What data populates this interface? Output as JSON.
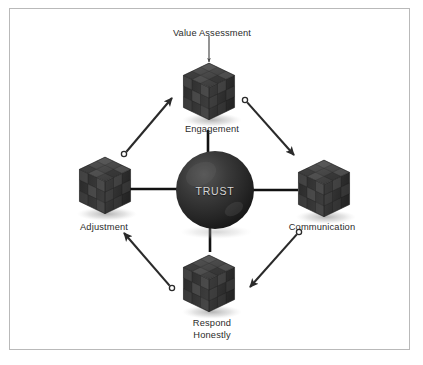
{
  "figure": {
    "title_text": "Trust cycle diagram",
    "center": {
      "label": "TRUST",
      "shape": "sphere",
      "color": "#2e2e2e",
      "label_color": "#d5d5d5",
      "cx": 215,
      "cy": 190,
      "r": 39
    },
    "frame": {
      "border_color": "#b9b9b9",
      "background": "#ffffff"
    },
    "nodes": [
      {
        "id": "engagement",
        "label": "Engagement",
        "icon": "cube-icon",
        "position": "top",
        "cx": 208,
        "cy": 93,
        "label_x": 212,
        "label_y": 124
      },
      {
        "id": "communication",
        "label": "Communication",
        "icon": "cube-icon",
        "position": "right",
        "cx": 322,
        "cy": 190,
        "label_x": 322,
        "label_y": 222
      },
      {
        "id": "respond-honestly",
        "label": "Respond\nHonestly",
        "label_line_1": "Respond",
        "label_line_2": "Honestly",
        "icon": "cube-icon",
        "position": "bottom",
        "cx": 208,
        "cy": 285,
        "label_x": 212,
        "label_y": 318
      },
      {
        "id": "adjustment",
        "label": "Adjustment",
        "icon": "cube-icon",
        "position": "left",
        "cx": 103,
        "cy": 187,
        "label_x": 104,
        "label_y": 222
      }
    ],
    "input_annotation": {
      "label": "Value Assessment",
      "label_x": 212,
      "label_y": 28,
      "arrow": "down-arrow-icon",
      "target": "engagement"
    },
    "connectors": [
      {
        "id": "spoke-top",
        "from": "center",
        "to": "engagement",
        "style": "line"
      },
      {
        "id": "spoke-right",
        "from": "center",
        "to": "communication",
        "style": "line"
      },
      {
        "id": "spoke-bottom",
        "from": "center",
        "to": "respond-honestly",
        "style": "line"
      },
      {
        "id": "spoke-left",
        "from": "center",
        "to": "adjustment",
        "style": "line"
      }
    ],
    "cycle_arrows": [
      {
        "id": "arrow-adjustment-to-engagement",
        "from": "adjustment",
        "to": "engagement",
        "direction": "up-right"
      },
      {
        "id": "arrow-engagement-to-communication",
        "from": "engagement",
        "to": "communication",
        "direction": "down-right"
      },
      {
        "id": "arrow-communication-to-respond",
        "from": "communication",
        "to": "respond-honestly",
        "direction": "down-left"
      },
      {
        "id": "arrow-respond-to-adjustment",
        "from": "respond-honestly",
        "to": "adjustment",
        "direction": "up-left"
      }
    ],
    "colors": {
      "line": "#111111",
      "arrow": "#2a2a2a",
      "cube_dark": "#2f2f2f",
      "cube_mid": "#4a4a4a",
      "cube_light": "#6e6e6e",
      "text": "#2b2b2b",
      "shadow": "#c4c4c4"
    }
  }
}
